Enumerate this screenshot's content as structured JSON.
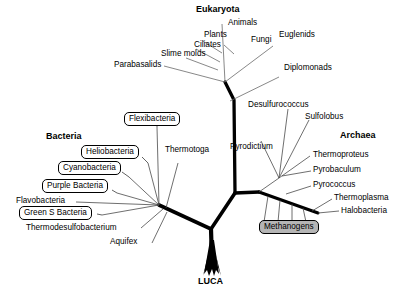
{
  "figure": {
    "type": "phylogenetic-tree",
    "root_label": "LUCA",
    "domains": [
      {
        "id": "eukaryota",
        "label": "Eukaryota"
      },
      {
        "id": "bacteria",
        "label": "Bacteria"
      },
      {
        "id": "archaea",
        "label": "Archaea"
      }
    ]
  },
  "taxa": {
    "eukaryota": [
      {
        "id": "animals",
        "label": "Animals",
        "boxed": false,
        "shaded": false
      },
      {
        "id": "plants",
        "label": "Plants",
        "boxed": false,
        "shaded": false
      },
      {
        "id": "fungi",
        "label": "Fungi",
        "boxed": false,
        "shaded": false
      },
      {
        "id": "euglenids",
        "label": "Euglenids",
        "boxed": false,
        "shaded": false
      },
      {
        "id": "ciliates",
        "label": "Ciliates",
        "boxed": false,
        "shaded": false
      },
      {
        "id": "slime-molds",
        "label": "Slime molds",
        "boxed": false,
        "shaded": false
      },
      {
        "id": "parabasalids",
        "label": "Parabasalids",
        "boxed": false,
        "shaded": false
      },
      {
        "id": "diplomonads",
        "label": "Diplomonads",
        "boxed": false,
        "shaded": false
      }
    ],
    "bacteria": [
      {
        "id": "flexibacteria",
        "label": "Flexibacteria",
        "boxed": true,
        "shaded": false
      },
      {
        "id": "heliobacteria",
        "label": "Heliobacteria",
        "boxed": true,
        "shaded": false
      },
      {
        "id": "cyanobacteria",
        "label": "Cyanobacteria",
        "boxed": true,
        "shaded": false
      },
      {
        "id": "purple-bacteria",
        "label": "Purple Bacteria",
        "boxed": true,
        "shaded": false
      },
      {
        "id": "flavobacteria",
        "label": "Flavobacteria",
        "boxed": false,
        "shaded": false
      },
      {
        "id": "green-s-bacteria",
        "label": "Green S Bacteria",
        "boxed": true,
        "shaded": false
      },
      {
        "id": "thermodesulfobacterium",
        "label": "Thermodesulfobacterium",
        "boxed": false,
        "shaded": false
      },
      {
        "id": "aquifex",
        "label": "Aquifex",
        "boxed": false,
        "shaded": false
      },
      {
        "id": "thermotoga",
        "label": "Thermotoga",
        "boxed": false,
        "shaded": false
      }
    ],
    "archaea": [
      {
        "id": "desulfurococcus",
        "label": "Desulfurococcus",
        "boxed": false,
        "shaded": false
      },
      {
        "id": "sulfolobus",
        "label": "Sulfolobus",
        "boxed": false,
        "shaded": false
      },
      {
        "id": "pyrodictium",
        "label": "Pyrodictium",
        "boxed": false,
        "shaded": false
      },
      {
        "id": "thermoproteus",
        "label": "Thermoproteus",
        "boxed": false,
        "shaded": false
      },
      {
        "id": "pyrobaculum",
        "label": "Pyrobaculum",
        "boxed": false,
        "shaded": false
      },
      {
        "id": "pyrococcus",
        "label": "Pyrococcus",
        "boxed": false,
        "shaded": false
      },
      {
        "id": "thermoplasma",
        "label": "Thermoplasma",
        "boxed": false,
        "shaded": false
      },
      {
        "id": "halobacteria",
        "label": "Halobacteria",
        "boxed": false,
        "shaded": false
      },
      {
        "id": "methanogens",
        "label": "Methanogens",
        "boxed": true,
        "shaded": true
      }
    ]
  },
  "colors": {
    "background": "#ffffff",
    "line": "#000000",
    "thin_line": "#555555",
    "shaded_box_fill": "#b5b5b5",
    "text": "#000000"
  }
}
